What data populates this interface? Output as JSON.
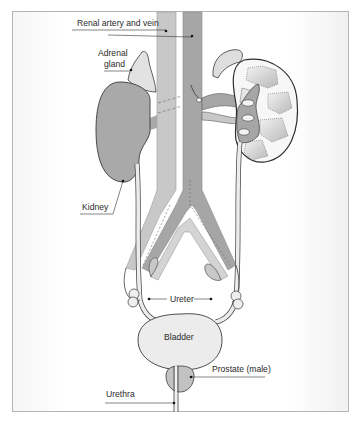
{
  "diagram": {
    "labels": {
      "renal_artery_vein": "Renal artery and vein",
      "adrenal_gland_line1": "Adrenal",
      "adrenal_gland_line2": "gland",
      "kidney": "Kidney",
      "ureter": "Ureter",
      "bladder": "Bladder",
      "prostate": "Prostate (male)",
      "urethra": "Urethra"
    },
    "colors": {
      "kidney_fill": "#a9a9a9",
      "vein_fill": "#c8c8c8",
      "artery_fill": "#a6a6a6",
      "organ_light": "#ececec",
      "outline": "#3a3a3a",
      "leader_line": "#333333",
      "frame_border": "#b5b5b5"
    }
  }
}
